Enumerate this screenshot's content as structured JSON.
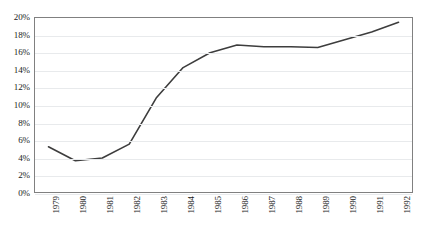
{
  "chart_data": {
    "type": "line",
    "title": "",
    "subtitle": "",
    "xlabel": "",
    "ylabel": "",
    "categories": [
      "1979",
      "1980",
      "1981",
      "1982",
      "1983",
      "1984",
      "1985",
      "1986",
      "1987",
      "1988",
      "1989",
      "1990",
      "1991",
      "1992"
    ],
    "values": [
      5.2,
      3.6,
      3.9,
      5.5,
      10.8,
      14.3,
      16.0,
      16.9,
      16.7,
      16.7,
      16.6,
      17.5,
      18.4,
      19.5
    ],
    "series": [
      {
        "name": "",
        "values": [
          5.2,
          3.6,
          3.9,
          5.5,
          10.8,
          14.3,
          16.0,
          16.9,
          16.7,
          16.7,
          16.6,
          17.5,
          18.4,
          19.5
        ]
      }
    ],
    "ylim": [
      0,
      20
    ],
    "ytick_values": [
      0,
      2,
      4,
      6,
      8,
      10,
      12,
      14,
      16,
      18,
      20
    ],
    "ytick_labels": [
      "0%",
      "2%",
      "4%",
      "6%",
      "8%",
      "10%",
      "12%",
      "14%",
      "16%",
      "18%",
      "20%"
    ],
    "xtick_labels": [
      "1979",
      "1980",
      "1981",
      "1982",
      "1983",
      "1984",
      "1985",
      "1986",
      "1987",
      "1988",
      "1989",
      "1990",
      "1991",
      "1992"
    ],
    "xtick_rotation": 90,
    "grid": true,
    "grid_axis": "y",
    "legend": false,
    "legend_position": "none",
    "line_color": "#3d3d3d",
    "grid_color": "#e8eaec",
    "axis_color": "#808080",
    "background_color": "#ffffff",
    "text_color": "#1a1a1a",
    "markers": false,
    "line_width": 1.6,
    "annotations": []
  }
}
